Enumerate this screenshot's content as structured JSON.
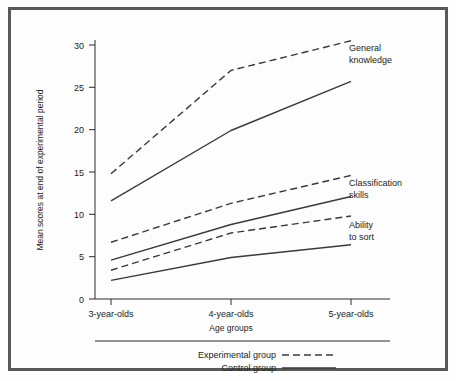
{
  "chart_data": {
    "type": "line",
    "title": "",
    "xlabel": "Age groups",
    "ylabel": "Mean scores at end of experimental period",
    "categories": [
      "3-year-olds",
      "4-year-olds",
      "5-year-olds"
    ],
    "ylim": [
      0,
      32
    ],
    "yticks": [
      0,
      5,
      10,
      15,
      20,
      25,
      30
    ],
    "ytick_labels": [
      "0",
      "5",
      "10",
      "15",
      "20",
      "25",
      "30"
    ],
    "grid": false,
    "legend_position": "bottom",
    "series": [
      {
        "name": "General knowledge — Experimental group",
        "measure": "General knowledge",
        "group": "Experimental group",
        "style": "dashed",
        "values": [
          14.8,
          27.0,
          30.5
        ]
      },
      {
        "name": "General knowledge — Control group",
        "measure": "General knowledge",
        "group": "Control group",
        "style": "solid",
        "values": [
          11.6,
          19.9,
          25.7
        ]
      },
      {
        "name": "Classification skills — Experimental group",
        "measure": "Classification skills",
        "group": "Experimental group",
        "style": "dashed",
        "values": [
          6.7,
          11.3,
          14.6
        ]
      },
      {
        "name": "Classification skills — Control group",
        "measure": "Classification skills",
        "group": "Control group",
        "style": "solid",
        "values": [
          4.6,
          8.8,
          12.1
        ]
      },
      {
        "name": "Ability to sort — Experimental group",
        "measure": "Ability to sort",
        "group": "Experimental group",
        "style": "dashed",
        "values": [
          3.4,
          7.8,
          9.8
        ]
      },
      {
        "name": "Ability to sort — Control group",
        "measure": "Ability to sort",
        "group": "Control group",
        "style": "solid",
        "values": [
          2.2,
          4.9,
          6.4
        ]
      }
    ],
    "annotations": [
      {
        "text_line1": "General",
        "text_line2": "knowledge"
      },
      {
        "text_line1": "Classification",
        "text_line2": "skills"
      },
      {
        "text_line1": "Ability",
        "text_line2": "to sort"
      }
    ],
    "legend": [
      {
        "label": "Experimental group",
        "style": "dashed"
      },
      {
        "label": "Control group",
        "style": "solid"
      }
    ]
  },
  "axis": {
    "y_label": "Mean scores at end of experimental period",
    "x_label": "Age groups",
    "y_ticks": {
      "t0": "0",
      "t5": "5",
      "t10": "10",
      "t15": "15",
      "t20": "20",
      "t25": "25",
      "t30": "30"
    },
    "x_ticks": {
      "c0": "3-year-olds",
      "c1": "4-year-olds",
      "c2": "5-year-olds"
    }
  },
  "annotations": {
    "general_knowledge_l1": "General",
    "general_knowledge_l2": "knowledge",
    "classification_l1": "Classification",
    "classification_l2": "skills",
    "ability_l1": "Ability",
    "ability_l2": "to sort"
  },
  "legend": {
    "experimental": "Experimental group",
    "control": "Control group"
  },
  "colors": {
    "frame": "#595959",
    "axis": "#2a2a2a",
    "line": "#3a3a3a",
    "background": "#fdfdfd"
  }
}
